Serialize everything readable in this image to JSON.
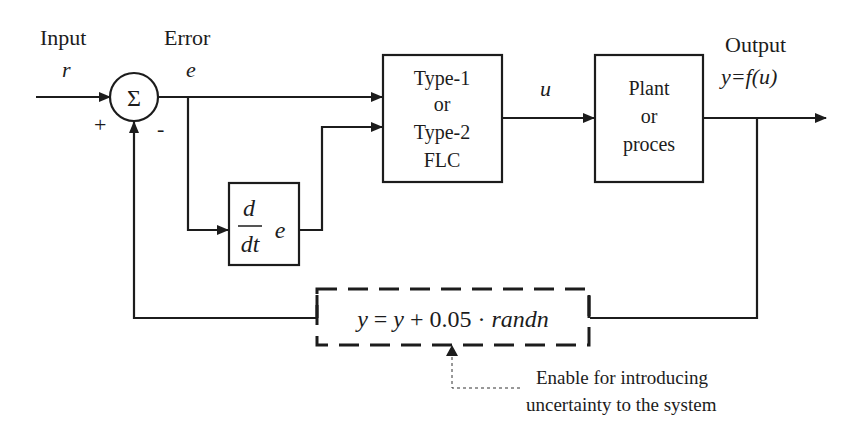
{
  "diagram": {
    "type": "control-loop-block-diagram",
    "labels": {
      "input": "Input",
      "input_symbol": "r",
      "error": "Error",
      "error_symbol": "e",
      "control_symbol": "u",
      "output": "Output",
      "output_eq": "y=f(u)",
      "plus_sign": "+",
      "minus_sign": "-"
    },
    "blocks": {
      "summing_junction": {
        "symbol": "Σ"
      },
      "controller": {
        "lines": [
          "Type-1",
          "or",
          "Type-2",
          "FLC"
        ]
      },
      "plant": {
        "lines": [
          "Plant",
          "or",
          "proces"
        ]
      },
      "derivative": {
        "numerator": "d",
        "denominator": "dt",
        "variable": "e"
      },
      "noise": {
        "equation_parts": [
          "y",
          "=",
          "y",
          "+",
          "0.05",
          "·",
          "randn"
        ],
        "style": "dashed"
      }
    },
    "annotation": {
      "lines": [
        "Enable for introducing",
        "uncertainty to the system"
      ]
    },
    "colors": {
      "stroke": "#1c1c1c",
      "background": "#ffffff"
    }
  }
}
